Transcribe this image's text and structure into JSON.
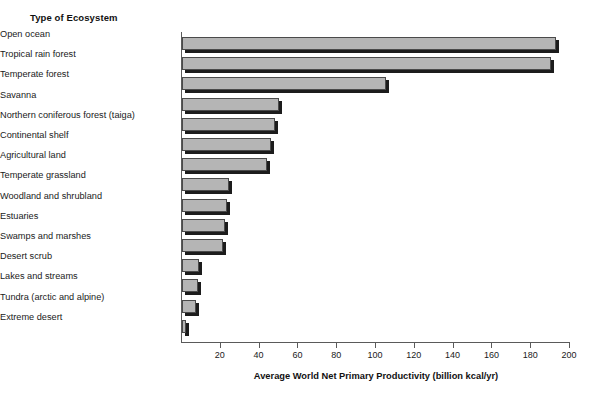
{
  "chart_data": {
    "type": "bar",
    "orientation": "horizontal",
    "title": "",
    "xlabel": "Average World Net Primary Productivity (billion kcal/yr)",
    "ylabel": "Type of Ecosystem",
    "xlim": [
      0,
      200
    ],
    "xticks": [
      20,
      40,
      60,
      80,
      100,
      120,
      140,
      160,
      180,
      200
    ],
    "grid": false,
    "legend": null,
    "categories": [
      "Open ocean",
      "Tropical rain forest",
      "Temperate forest",
      "Savanna",
      "Northern coniferous forest (taiga)",
      "Continental shelf",
      "Agricultural land",
      "Temperate grassland",
      "Woodland and shrubland",
      "Estuaries",
      "Swamps and marshes",
      "Desert scrub",
      "Lakes and streams",
      "Tundra (arctic and alpine)",
      "Extreme desert"
    ],
    "values": [
      193,
      190,
      105,
      50,
      48,
      46,
      44,
      24,
      23,
      22,
      21,
      9,
      8,
      7,
      2
    ],
    "bar_fill_color": "#b5b5b5",
    "bar_edge_color": "#4a4a4a",
    "bar_shadow_color": "#1c1c1c"
  },
  "axis": {
    "y_title": "Type of Ecosystem",
    "x_title": "Average World Net Primary Productivity (billion kcal/yr)",
    "x_tick_labels": [
      "20",
      "40",
      "60",
      "80",
      "100",
      "120",
      "140",
      "160",
      "180",
      "200"
    ]
  }
}
